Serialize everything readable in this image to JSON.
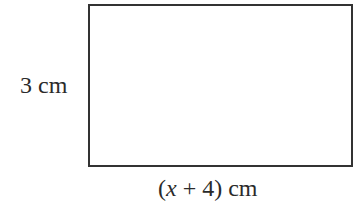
{
  "diagram": {
    "shape": "rectangle",
    "height_label": "3 cm",
    "width_label": {
      "open": "(",
      "variable": "x",
      "rest": " + 4)",
      "unit": " cm"
    }
  }
}
